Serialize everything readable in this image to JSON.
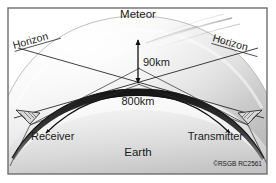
{
  "figure": {
    "labels": {
      "meteor": "Meteor",
      "horizon_left": "Horizon",
      "horizon_right": "Horizon",
      "altitude": "90km",
      "path_distance": "800km",
      "receiver": "Receiver",
      "transmitter": "Transmitter",
      "earth": "Earth"
    },
    "credit": "©RSGB RC2561",
    "colors": {
      "background": "#ffffff",
      "border": "#6e6e6e",
      "ink": "#1a1a1a",
      "atmosphere_light": "#fdfdfd",
      "atmosphere_mid": "#d8d8d8",
      "atmosphere_dark": "#b0b0b0",
      "earth_light": "#f2f2f2",
      "earth_shadow": "#bdbdbd",
      "ionosphere_band": "#2b2b2b"
    }
  }
}
